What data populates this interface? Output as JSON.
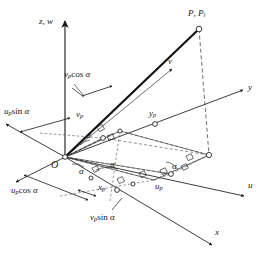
{
  "figure": {
    "type": "geometric-vector-decomposition-diagram",
    "background_color": "#ffffff",
    "line_color": "#1a1a1a",
    "dashed_color": "#555555"
  },
  "axes": [
    {
      "id": "z",
      "label": "z, w",
      "label_x": 39,
      "label_y": 22
    },
    {
      "id": "y",
      "label": "y",
      "label_x": 248,
      "label_y": 88
    },
    {
      "id": "v",
      "label": "v",
      "label_x": 168,
      "label_y": 62
    },
    {
      "id": "u",
      "label": "u",
      "label_x": 248,
      "label_y": 186
    },
    {
      "id": "x",
      "label": "x",
      "label_x": 215,
      "label_y": 233
    }
  ],
  "points": [
    {
      "id": "origin",
      "label": "O",
      "label_x": 51,
      "label_y": 163
    },
    {
      "id": "P",
      "label_main": "P",
      "label_sub_main": "",
      "label_secondary": "P",
      "label_sub_secondary": "l",
      "label_x": 190,
      "label_y": 10
    }
  ],
  "component_labels": [
    {
      "id": "vp-cos-alpha",
      "base": "v",
      "sub": "p",
      "fn": "cos",
      "greek": "α",
      "x": 64,
      "y": 74
    },
    {
      "id": "up-sin-alpha",
      "base": "u",
      "sub": "p",
      "fn": "sin",
      "greek": "α",
      "x": 4,
      "y": 110
    },
    {
      "id": "up-cos-alpha",
      "base": "u",
      "sub": "p",
      "fn": "cos",
      "greek": "α",
      "x": 11,
      "y": 189
    },
    {
      "id": "vp-sin-alpha",
      "base": "v",
      "sub": "p",
      "fn": "sin",
      "greek": "α",
      "x": 90,
      "y": 216
    }
  ],
  "projection_labels": [
    {
      "id": "vp",
      "base": "v",
      "sub": "p",
      "x": 76,
      "y": 113
    },
    {
      "id": "yp",
      "base": "y",
      "sub": "p",
      "x": 149,
      "y": 112
    },
    {
      "id": "xp",
      "base": "x",
      "sub": "p",
      "x": 98,
      "y": 186
    },
    {
      "id": "up",
      "base": "u",
      "sub": "p",
      "x": 155,
      "y": 185
    }
  ],
  "angle_labels": [
    {
      "id": "alpha-1",
      "text": "α",
      "x": 86,
      "y": 134
    },
    {
      "id": "alpha-2",
      "text": "α",
      "x": 110,
      "y": 163
    },
    {
      "id": "alpha-3",
      "text": "α",
      "x": 79,
      "y": 170
    },
    {
      "id": "alpha-4",
      "text": "α",
      "x": 172,
      "y": 165
    }
  ],
  "markers": {
    "node_radius": 2.4,
    "node_fill": "#ffffff",
    "node_stroke": "#1a1a1a"
  }
}
